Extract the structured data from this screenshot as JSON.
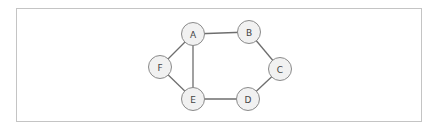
{
  "diagram": {
    "type": "undirected-graph",
    "frame": {
      "border_color": "#c4c4c4",
      "background": "#ffffff"
    },
    "style": {
      "node_fill": "#f1f1f1",
      "node_stroke": "#8a8a8a",
      "edge_color": "#6e6e6e",
      "label_color": "#444444",
      "node_radius": 11.5
    },
    "nodes": [
      {
        "id": "A",
        "label": "A",
        "x": 193,
        "y": 34
      },
      {
        "id": "B",
        "label": "B",
        "x": 249,
        "y": 32
      },
      {
        "id": "C",
        "label": "C",
        "x": 280,
        "y": 69
      },
      {
        "id": "D",
        "label": "D",
        "x": 248,
        "y": 99
      },
      {
        "id": "E",
        "label": "E",
        "x": 193,
        "y": 99
      },
      {
        "id": "F",
        "label": "F",
        "x": 160,
        "y": 67
      }
    ],
    "edges": [
      {
        "from": "A",
        "to": "B"
      },
      {
        "from": "B",
        "to": "C"
      },
      {
        "from": "C",
        "to": "D"
      },
      {
        "from": "D",
        "to": "E"
      },
      {
        "from": "E",
        "to": "F"
      },
      {
        "from": "F",
        "to": "A"
      },
      {
        "from": "A",
        "to": "E"
      }
    ]
  }
}
